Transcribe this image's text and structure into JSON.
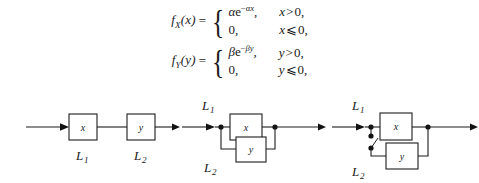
{
  "formulas": [
    {
      "lhs_f": "f",
      "lhs_sub": "X",
      "lhs_arg": "(x)",
      "equals": "=",
      "case1_coef": "α",
      "case1_base": "e",
      "case1_exp_op": "−",
      "case1_exp": "αx",
      "case1_comma": ",",
      "case1_var": "x",
      "case1_rel": ">",
      "case1_bound": "0,",
      "case2_val": "0,",
      "case2_var": "x",
      "case2_rel": "⩽",
      "case2_bound": "0,"
    },
    {
      "lhs_f": "f",
      "lhs_sub": "Y",
      "lhs_arg": "(y)",
      "equals": "=",
      "case1_coef": "β",
      "case1_base": "e",
      "case1_exp_op": "−",
      "case1_exp": "βy",
      "case1_comma": ",",
      "case1_var": "y",
      "case1_rel": ">",
      "case1_bound": "0,",
      "case2_val": "0,",
      "case2_var": "y",
      "case2_rel": "⩽",
      "case2_bound": "0,"
    }
  ],
  "diagrams": {
    "series": {
      "name": "series-configuration",
      "box_x": "x",
      "box_y": "y",
      "label_l1": "L",
      "label_l1_sub": "1",
      "label_l2": "L",
      "label_l2_sub": "2"
    },
    "parallel": {
      "name": "parallel-configuration",
      "box_x": "x",
      "box_y": "y",
      "label_l1": "L",
      "label_l1_sub": "1",
      "label_l2": "L",
      "label_l2_sub": "2"
    },
    "switch": {
      "name": "switched-standby-configuration",
      "box_x": "x",
      "box_y": "y",
      "label_l1": "L",
      "label_l1_sub": "1",
      "label_l2": "L",
      "label_l2_sub": "2"
    }
  },
  "colors": {
    "ink": "#1a1a1a",
    "wire": "#1d1d1d",
    "paper": "#ffffff"
  }
}
